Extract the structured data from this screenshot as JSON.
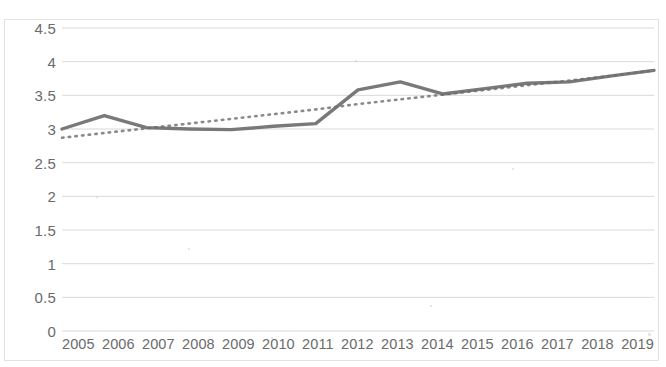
{
  "chart_data": {
    "type": "line",
    "title": "",
    "xlabel": "",
    "ylabel": "",
    "categories": [
      "2005",
      "2006",
      "2007",
      "2008",
      "2009",
      "2010",
      "2011",
      "2012",
      "2013",
      "2014",
      "2015",
      "2016",
      "2017",
      "2018",
      "2019"
    ],
    "x": [
      2005,
      2006,
      2007,
      2008,
      2009,
      2010,
      2011,
      2012,
      2013,
      2014,
      2015,
      2016,
      2017,
      2018,
      2019
    ],
    "ylim": [
      0,
      4.5
    ],
    "xlim": [
      2005,
      2019
    ],
    "grid": true,
    "legend": "none",
    "y_ticks": [
      "0",
      "0.5",
      "1",
      "1.5",
      "2",
      "2.5",
      "3",
      "3.5",
      "4",
      "4.5"
    ],
    "y_tick_values": [
      0,
      0.5,
      1,
      1.5,
      2,
      2.5,
      3,
      3.5,
      4,
      4.5
    ],
    "series": [
      {
        "name": "data",
        "style": "solid",
        "color": "#6e6e6e",
        "values": [
          3.0,
          3.2,
          3.02,
          3.0,
          2.99,
          3.04,
          3.08,
          3.58,
          3.7,
          3.52,
          3.6,
          3.68,
          3.7,
          3.79,
          3.87
        ]
      },
      {
        "name": "trendline",
        "style": "dotted",
        "color": "#7a7a7a",
        "values": [
          2.87,
          2.94,
          3.01,
          3.08,
          3.15,
          3.22,
          3.29,
          3.37,
          3.44,
          3.51,
          3.58,
          3.65,
          3.72,
          3.79,
          3.87
        ]
      }
    ]
  },
  "axis": {
    "y_labels": [
      "4.5",
      "4",
      "3.5",
      "3",
      "2.5",
      "2",
      "1.5",
      "1",
      "0.5",
      "0"
    ],
    "x_labels": [
      "2005",
      "2006",
      "2007",
      "2008",
      "2009",
      "2010",
      "2011",
      "2012",
      "2013",
      "2014",
      "2015",
      "2016",
      "2017",
      "2018",
      "2019"
    ]
  },
  "colors": {
    "line": "#6e6e6e",
    "trend": "#7a7a7a",
    "grid": "#d9d9d9",
    "text": "#6b6b6b",
    "frame": "#e2e2e2",
    "background": "#ffffff"
  }
}
